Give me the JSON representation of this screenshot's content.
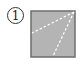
{
  "figure": {
    "label": "1",
    "colors": {
      "fill": "#b4b4b4",
      "stroke": "#6e6e6e",
      "dash": "#ffffff"
    },
    "square": {
      "x": 31,
      "y": 11,
      "w": 44,
      "h": 46
    },
    "lines": [
      {
        "x1": 74,
        "y1": 12,
        "x2": 32,
        "y2": 33
      },
      {
        "x1": 74,
        "y1": 12,
        "x2": 53,
        "y2": 56
      }
    ]
  }
}
